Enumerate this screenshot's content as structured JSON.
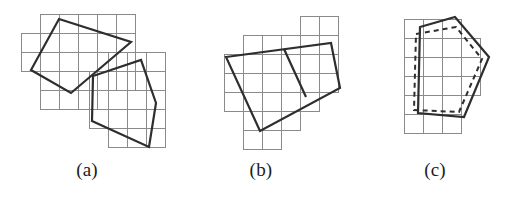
{
  "figure": {
    "width": 522,
    "height": 197,
    "background_color": "#ffffff",
    "grid_color": "#8a8a8a",
    "outline_color": "#2e2e2e",
    "dashed_color": "#2e2e2e",
    "grid_cell_size": 19,
    "grid_stroke_width": 1,
    "outline_stroke_width": 2.2,
    "dashed_stroke_width": 2.0,
    "dash_pattern": "5 4"
  },
  "panels": [
    {
      "id": "a",
      "caption": "(a)",
      "description": "two overlapping polygons each on its own axis-aligned cell grid",
      "grids": [
        {
          "name": "grid-upper",
          "cells": [
            [
              40,
              14
            ],
            [
              59,
              14
            ],
            [
              78,
              14
            ],
            [
              97,
              14
            ],
            [
              116,
              14
            ],
            [
              21,
              33
            ],
            [
              40,
              33
            ],
            [
              59,
              33
            ],
            [
              78,
              33
            ],
            [
              97,
              33
            ],
            [
              116,
              33
            ],
            [
              21,
              52
            ],
            [
              40,
              52
            ],
            [
              59,
              52
            ],
            [
              78,
              52
            ],
            [
              97,
              52
            ],
            [
              116,
              52
            ],
            [
              40,
              71
            ],
            [
              59,
              71
            ],
            [
              78,
              71
            ],
            [
              97,
              71
            ],
            [
              116,
              71
            ],
            [
              40,
              90
            ],
            [
              59,
              90
            ],
            [
              78,
              90
            ]
          ]
        },
        {
          "name": "grid-lower",
          "cells": [
            [
              108,
              52
            ],
            [
              127,
              52
            ],
            [
              146,
              52
            ],
            [
              89,
              71
            ],
            [
              108,
              71
            ],
            [
              127,
              71
            ],
            [
              146,
              71
            ],
            [
              89,
              90
            ],
            [
              108,
              90
            ],
            [
              127,
              90
            ],
            [
              146,
              90
            ],
            [
              89,
              109
            ],
            [
              108,
              109
            ],
            [
              127,
              109
            ],
            [
              146,
              109
            ],
            [
              108,
              128
            ],
            [
              127,
              128
            ],
            [
              146,
              128
            ]
          ]
        }
      ],
      "polygons": [
        {
          "name": "polygon-upper-quad",
          "style": "solid",
          "points": [
            [
              59,
              19
            ],
            [
              131,
              42
            ],
            [
              71,
              93
            ],
            [
              31,
              70
            ]
          ]
        },
        {
          "name": "polygon-lower-pentagon",
          "style": "solid",
          "points": [
            [
              93,
              76
            ],
            [
              141,
              60
            ],
            [
              156,
              103
            ],
            [
              149,
              147
            ],
            [
              92,
              121
            ]
          ]
        }
      ],
      "segments": []
    },
    {
      "id": "b",
      "caption": "(b)",
      "description": "a single rotated quadrilateral divided by one internal segment, over a cell grid",
      "grids": [
        {
          "name": "grid-main",
          "cells": [
            [
              300,
              16
            ],
            [
              319,
              16
            ],
            [
              243,
              35
            ],
            [
              262,
              35
            ],
            [
              281,
              35
            ],
            [
              300,
              35
            ],
            [
              319,
              35
            ],
            [
              224,
              54
            ],
            [
              243,
              54
            ],
            [
              262,
              54
            ],
            [
              281,
              54
            ],
            [
              300,
              54
            ],
            [
              319,
              54
            ],
            [
              224,
              73
            ],
            [
              243,
              73
            ],
            [
              262,
              73
            ],
            [
              281,
              73
            ],
            [
              300,
              73
            ],
            [
              319,
              73
            ],
            [
              224,
              92
            ],
            [
              243,
              92
            ],
            [
              262,
              92
            ],
            [
              281,
              92
            ],
            [
              300,
              92
            ],
            [
              243,
              111
            ],
            [
              262,
              111
            ],
            [
              281,
              111
            ],
            [
              243,
              130
            ],
            [
              262,
              130
            ]
          ]
        }
      ],
      "polygons": [
        {
          "name": "polygon-quad",
          "style": "solid",
          "points": [
            [
              226,
              57
            ],
            [
              331,
              43
            ],
            [
              340,
              88
            ],
            [
              260,
              131
            ]
          ]
        }
      ],
      "segments": [
        {
          "name": "internal-divider",
          "style": "solid",
          "points": [
            [
              284,
              49
            ],
            [
              306,
              97
            ]
          ]
        }
      ]
    },
    {
      "id": "c",
      "caption": "(c)",
      "description": "a solid pentagon overlaid with a slightly offset dashed pentagon",
      "grids": [
        {
          "name": "grid-main",
          "cells": [
            [
              404,
              19
            ],
            [
              423,
              19
            ],
            [
              442,
              19
            ],
            [
              404,
              38
            ],
            [
              423,
              38
            ],
            [
              442,
              38
            ],
            [
              461,
              38
            ],
            [
              404,
              57
            ],
            [
              423,
              57
            ],
            [
              442,
              57
            ],
            [
              461,
              57
            ],
            [
              404,
              76
            ],
            [
              423,
              76
            ],
            [
              442,
              76
            ],
            [
              461,
              76
            ],
            [
              404,
              95
            ],
            [
              423,
              95
            ],
            [
              442,
              95
            ],
            [
              404,
              114
            ],
            [
              423,
              114
            ],
            [
              442,
              114
            ]
          ]
        }
      ],
      "polygons": [
        {
          "name": "polygon-solid-pentagon",
          "style": "solid",
          "points": [
            [
              420,
              27
            ],
            [
              455,
              17
            ],
            [
              489,
              57
            ],
            [
              464,
              117
            ],
            [
              418,
              113
            ]
          ]
        },
        {
          "name": "polygon-dashed-pentagon",
          "style": "dashed",
          "points": [
            [
              416,
              34
            ],
            [
              456,
              27
            ],
            [
              482,
              59
            ],
            [
              459,
              112
            ],
            [
              414,
              110
            ]
          ]
        }
      ],
      "segments": []
    }
  ]
}
